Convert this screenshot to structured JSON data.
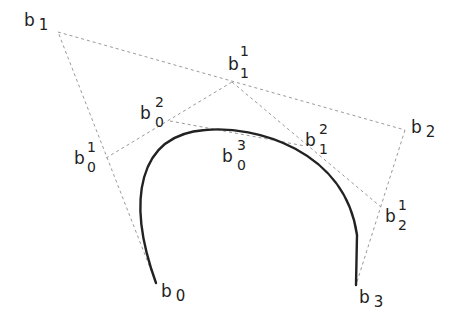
{
  "diagram": {
    "title": "",
    "colors": {
      "background": "#ffffff",
      "curve": "#222222",
      "construction_lines": "#9a9a9a",
      "text": "#222222"
    },
    "points": {
      "b0": {
        "x": 156,
        "y": 283,
        "base": "b",
        "sub": "0",
        "sup": ""
      },
      "b1": {
        "x": 58,
        "y": 32,
        "base": "b",
        "sub": "1",
        "sup": ""
      },
      "b2": {
        "x": 405,
        "y": 130,
        "base": "b",
        "sub": "2",
        "sup": ""
      },
      "b3": {
        "x": 356,
        "y": 285,
        "base": "b",
        "sub": "3",
        "sup": ""
      },
      "b0_1": {
        "x": 106,
        "y": 158,
        "base": "b",
        "sub": "0",
        "sup": "1"
      },
      "b1_1": {
        "x": 232,
        "y": 82,
        "base": "b",
        "sub": "1",
        "sup": "1"
      },
      "b2_1": {
        "x": 381,
        "y": 207,
        "base": "b",
        "sub": "2",
        "sup": "1"
      },
      "b0_2": {
        "x": 170,
        "y": 121,
        "base": "b",
        "sub": "0",
        "sup": "2"
      },
      "b1_2": {
        "x": 305,
        "y": 146,
        "base": "b",
        "sub": "1",
        "sup": "2"
      },
      "b0_3": {
        "x": 240,
        "y": 131,
        "base": "b",
        "sub": "0",
        "sup": "3"
      }
    },
    "labels": [
      {
        "id": "b1",
        "base": "b",
        "sub": "1",
        "sup": ""
      },
      {
        "id": "b2",
        "base": "b",
        "sub": "2",
        "sup": ""
      },
      {
        "id": "b0",
        "base": "b",
        "sub": "0",
        "sup": ""
      },
      {
        "id": "b3",
        "base": "b",
        "sub": "3",
        "sup": ""
      },
      {
        "id": "b1_1",
        "base": "b",
        "sub": "1",
        "sup": "1"
      },
      {
        "id": "b0_1",
        "base": "b",
        "sub": "0",
        "sup": "1"
      },
      {
        "id": "b2_1",
        "base": "b",
        "sub": "2",
        "sup": "1"
      },
      {
        "id": "b0_2",
        "base": "b",
        "sub": "0",
        "sup": "2"
      },
      {
        "id": "b1_2",
        "base": "b",
        "sub": "1",
        "sup": "2"
      },
      {
        "id": "b0_3",
        "base": "b",
        "sub": "0",
        "sup": "3"
      }
    ],
    "caption": "de Casteljau construction of a cubic Bézier curve"
  }
}
